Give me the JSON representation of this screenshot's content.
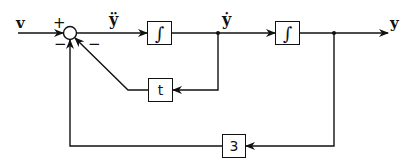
{
  "diagram": {
    "type": "block_diagram",
    "input_label": "v",
    "output_label": "y",
    "signals": {
      "yddot": "ÿ",
      "ydot": "ẏ",
      "y": "y"
    },
    "summing_junction": {
      "signs": {
        "input": "+",
        "left_feedback": "−",
        "right_feedback": "−"
      }
    },
    "blocks": [
      {
        "id": "integrator-1",
        "label": "∫"
      },
      {
        "id": "integrator-2",
        "label": "∫"
      },
      {
        "id": "gain-t",
        "label": "t"
      },
      {
        "id": "gain-3",
        "label": "3"
      }
    ],
    "connections": [
      {
        "from": "v",
        "to": "summing_junction",
        "sign": "+"
      },
      {
        "from": "summing_junction",
        "to": "integrator-1",
        "signal": "ÿ"
      },
      {
        "from": "integrator-1",
        "to": "integrator-2",
        "signal": "ẏ"
      },
      {
        "from": "integrator-2",
        "to": "output",
        "signal": "y"
      },
      {
        "from": "ẏ",
        "to": "gain-t"
      },
      {
        "from": "gain-t",
        "to": "summing_junction",
        "sign": "−"
      },
      {
        "from": "y",
        "to": "gain-3"
      },
      {
        "from": "gain-3",
        "to": "summing_junction",
        "sign": "−"
      }
    ],
    "colors": {
      "line": "#111111",
      "background": "#ffffff"
    }
  }
}
